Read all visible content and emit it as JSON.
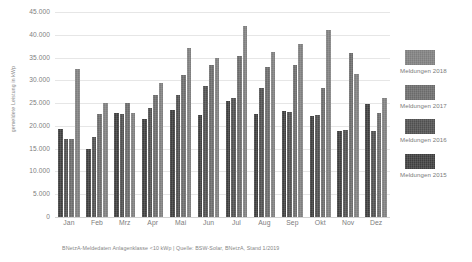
{
  "chart_data": {
    "type": "bar",
    "title": "",
    "subtitle": "",
    "xlabel": "",
    "ylabel": "gemeldete Leistung in kWp",
    "categories": [
      "Jan",
      "Feb",
      "Mrz",
      "Apr",
      "Mai",
      "Jun",
      "Jul",
      "Aug",
      "Sep",
      "Okt",
      "Nov",
      "Dez"
    ],
    "ylim": [
      0,
      45000
    ],
    "yticks": [
      "0",
      "5.000",
      "10.000",
      "15.000",
      "20.000",
      "25.000",
      "30.000",
      "35.000",
      "40.000",
      "45.000"
    ],
    "ytick_values": [
      0,
      5000,
      10000,
      15000,
      20000,
      25000,
      30000,
      35000,
      40000,
      45000
    ],
    "grid": true,
    "legend_position": "right",
    "series": [
      {
        "name": "Meldungen 2015",
        "color": "#3d3d3d",
        "values": [
          19400,
          15000,
          22800,
          21600,
          23500,
          22400,
          25500,
          22600,
          23200,
          22200,
          18800,
          24800
        ]
      },
      {
        "name": "Meldungen 2016",
        "color": "#4f4f4f",
        "values": [
          17100,
          17500,
          22700,
          23900,
          26800,
          28700,
          26100,
          28300,
          23000,
          22500,
          19000,
          18900
        ]
      },
      {
        "name": "Meldungen 2017",
        "color": "#6a6a6a",
        "values": [
          17100,
          22700,
          25000,
          26700,
          31200,
          33400,
          35300,
          32900,
          33400,
          28400,
          36100,
          22800
        ]
      },
      {
        "name": "Meldungen 2018",
        "color": "#7e7e7e",
        "values": [
          32500,
          25000,
          22800,
          29500,
          37200,
          34800,
          42000,
          36200,
          38000,
          41100,
          31400,
          26100
        ]
      }
    ],
    "caption": "BNetzA-Meldedaten Anlagenklasse <10 kWp | Quelle: BSW-Solar, BNetzA, Stand 1/2019"
  },
  "legend": {
    "items": [
      {
        "label": "Meldungen 2018",
        "color": "#7e7e7e"
      },
      {
        "label": "Meldungen 2017",
        "color": "#6a6a6a"
      },
      {
        "label": "Meldungen 2016",
        "color": "#4f4f4f"
      },
      {
        "label": "Meldungen 2015",
        "color": "#3d3d3d"
      }
    ]
  }
}
